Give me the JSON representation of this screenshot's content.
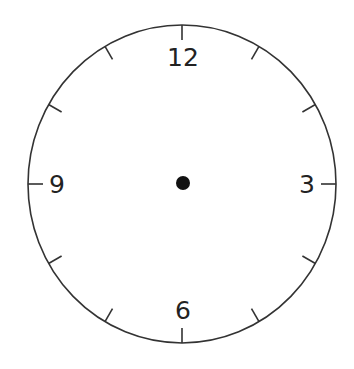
{
  "clock": {
    "title": "Blank clock face",
    "center": {
      "x": 182,
      "y": 184
    },
    "radius_x": 154,
    "radius_y": 159,
    "stroke_color": "#333333",
    "dot_color": "#111111",
    "background": "#ffffff",
    "tick_length": 15,
    "hour_ticks": [
      1,
      2,
      3,
      4,
      5,
      6,
      7,
      8,
      9,
      10,
      11,
      12
    ],
    "numerals": [
      {
        "label": "12",
        "hour": 12,
        "x": 183,
        "y": 57
      },
      {
        "label": "3",
        "hour": 3,
        "x": 307,
        "y": 184
      },
      {
        "label": "6",
        "hour": 6,
        "x": 183,
        "y": 310
      },
      {
        "label": "9",
        "hour": 9,
        "x": 57,
        "y": 184
      }
    ],
    "hands": []
  }
}
